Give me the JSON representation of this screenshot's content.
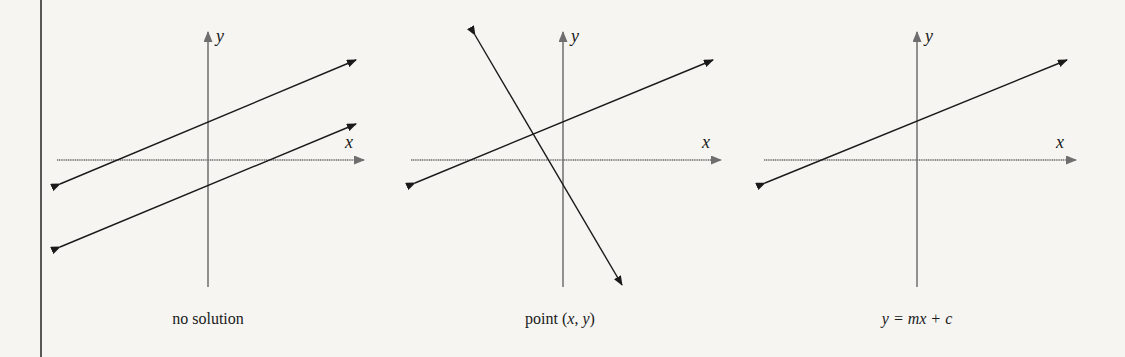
{
  "figure": {
    "panels": [
      {
        "id": "no-solution",
        "caption": "no solution",
        "x_axis_label": "x",
        "y_axis_label": "y",
        "lines": 2,
        "relationship": "parallel lines, no intersection"
      },
      {
        "id": "point",
        "caption_prefix": "point (",
        "caption_x": "x",
        "caption_sep": ", ",
        "caption_y": "y",
        "caption_suffix": ")",
        "x_axis_label": "x",
        "y_axis_label": "y",
        "lines": 2,
        "relationship": "lines intersect at one point"
      },
      {
        "id": "infinite",
        "caption": "y = mx + c",
        "x_axis_label": "x",
        "y_axis_label": "y",
        "lines": 1,
        "relationship": "coincident lines"
      }
    ],
    "colors": {
      "background": "#f6f5f2",
      "line": "#1a1a1a",
      "axis": "#6e6e6e"
    }
  }
}
